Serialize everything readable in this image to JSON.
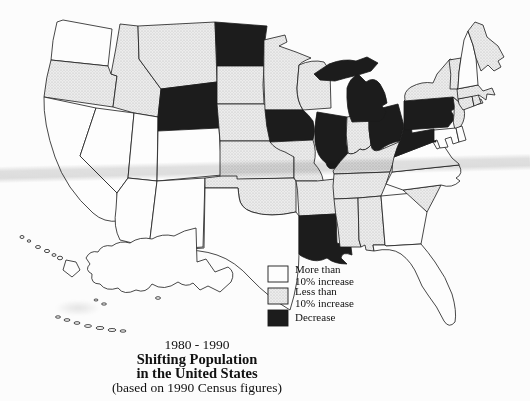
{
  "figure": {
    "title_line1": "1980 - 1990",
    "title_line2": "Shifting Population",
    "title_line3": "in the United States",
    "title_line4": "(based on 1990 Census figures)"
  },
  "legend": {
    "items": [
      {
        "key": "more",
        "line1": "More than",
        "line2": "10% increase"
      },
      {
        "key": "less",
        "line1": "Less than",
        "line2": "10% increase"
      },
      {
        "key": "decrease",
        "line1": "Decrease",
        "line2": ""
      }
    ]
  },
  "colors": {
    "more": "#fdfdfd",
    "less": "stipple-pattern",
    "decrease": "#1c1c1c",
    "outline": "#1a1a1a",
    "background": "#fcfcfc"
  },
  "map": {
    "states": [
      {
        "id": "WA",
        "name": "Washington",
        "category": "more"
      },
      {
        "id": "OR",
        "name": "Oregon",
        "category": "less"
      },
      {
        "id": "CA",
        "name": "California",
        "category": "more"
      },
      {
        "id": "NV",
        "name": "Nevada",
        "category": "more"
      },
      {
        "id": "ID",
        "name": "Idaho",
        "category": "less"
      },
      {
        "id": "MT",
        "name": "Montana",
        "category": "less"
      },
      {
        "id": "WY",
        "name": "Wyoming",
        "category": "decrease"
      },
      {
        "id": "UT",
        "name": "Utah",
        "category": "more"
      },
      {
        "id": "CO",
        "name": "Colorado",
        "category": "more"
      },
      {
        "id": "AZ",
        "name": "Arizona",
        "category": "more"
      },
      {
        "id": "NM",
        "name": "New Mexico",
        "category": "more"
      },
      {
        "id": "ND",
        "name": "North Dakota",
        "category": "decrease"
      },
      {
        "id": "SD",
        "name": "South Dakota",
        "category": "less"
      },
      {
        "id": "NE",
        "name": "Nebraska",
        "category": "less"
      },
      {
        "id": "KS",
        "name": "Kansas",
        "category": "less"
      },
      {
        "id": "OK",
        "name": "Oklahoma",
        "category": "less"
      },
      {
        "id": "TX",
        "name": "Texas",
        "category": "more"
      },
      {
        "id": "MN",
        "name": "Minnesota",
        "category": "less"
      },
      {
        "id": "IA",
        "name": "Iowa",
        "category": "decrease"
      },
      {
        "id": "MO",
        "name": "Missouri",
        "category": "less"
      },
      {
        "id": "AR",
        "name": "Arkansas",
        "category": "less"
      },
      {
        "id": "LA",
        "name": "Louisiana",
        "category": "decrease"
      },
      {
        "id": "WI",
        "name": "Wisconsin",
        "category": "less"
      },
      {
        "id": "IL",
        "name": "Illinois",
        "category": "decrease"
      },
      {
        "id": "MI",
        "name": "Michigan",
        "category": "decrease"
      },
      {
        "id": "IN",
        "name": "Indiana",
        "category": "less"
      },
      {
        "id": "OH",
        "name": "Ohio",
        "category": "decrease"
      },
      {
        "id": "KY",
        "name": "Kentucky",
        "category": "less"
      },
      {
        "id": "TN",
        "name": "Tennessee",
        "category": "less"
      },
      {
        "id": "MS",
        "name": "Mississippi",
        "category": "less"
      },
      {
        "id": "AL",
        "name": "Alabama",
        "category": "less"
      },
      {
        "id": "GA",
        "name": "Georgia",
        "category": "more"
      },
      {
        "id": "FL",
        "name": "Florida",
        "category": "more"
      },
      {
        "id": "SC",
        "name": "South Carolina",
        "category": "less"
      },
      {
        "id": "NC",
        "name": "North Carolina",
        "category": "more"
      },
      {
        "id": "VA",
        "name": "Virginia",
        "category": "more"
      },
      {
        "id": "WV",
        "name": "West Virginia",
        "category": "decrease"
      },
      {
        "id": "PA",
        "name": "Pennsylvania",
        "category": "decrease"
      },
      {
        "id": "NY",
        "name": "New York",
        "category": "less"
      },
      {
        "id": "NJ",
        "name": "New Jersey",
        "category": "less"
      },
      {
        "id": "MD",
        "name": "Maryland",
        "category": "more"
      },
      {
        "id": "DE",
        "name": "Delaware",
        "category": "more"
      },
      {
        "id": "CT",
        "name": "Connecticut",
        "category": "less"
      },
      {
        "id": "RI",
        "name": "Rhode Island",
        "category": "less"
      },
      {
        "id": "MA",
        "name": "Massachusetts",
        "category": "less"
      },
      {
        "id": "VT",
        "name": "Vermont",
        "category": "less"
      },
      {
        "id": "NH",
        "name": "New Hampshire",
        "category": "more"
      },
      {
        "id": "ME",
        "name": "Maine",
        "category": "less"
      },
      {
        "id": "AK",
        "name": "Alaska",
        "category": "more"
      },
      {
        "id": "HI",
        "name": "Hawaii",
        "category": "more"
      }
    ]
  }
}
